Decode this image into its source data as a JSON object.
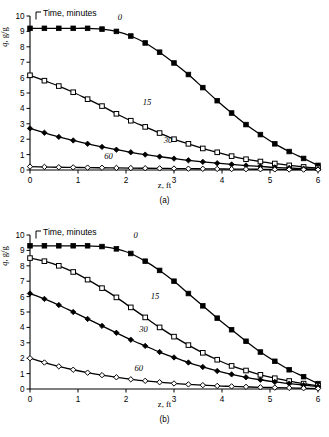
{
  "figure": {
    "axis_labels": {
      "x": "z, ft",
      "y_symbol": "q",
      "y_rest": ", g/g",
      "legend_title": "Time, minutes"
    }
  },
  "chart_data": [
    {
      "type": "line",
      "panel": "(a)",
      "title": "",
      "xlabel": "z, ft",
      "ylabel": "q̄, g/g",
      "legend_title": "Time, minutes",
      "legend_position": "inline-annotations",
      "grid": false,
      "xlim": [
        0,
        6
      ],
      "ylim": [
        0,
        10
      ],
      "xticks": [
        0,
        1,
        2,
        3,
        4,
        5,
        6
      ],
      "yticks": [
        0,
        1,
        2,
        3,
        4,
        5,
        6,
        7,
        8,
        9,
        10
      ],
      "x": [
        0,
        0.3,
        0.6,
        0.9,
        1.2,
        1.5,
        1.8,
        2.1,
        2.4,
        2.7,
        3.0,
        3.3,
        3.6,
        3.9,
        4.2,
        4.5,
        4.8,
        5.1,
        5.4,
        5.7,
        6.0
      ],
      "series": [
        {
          "name": "0",
          "label": "0",
          "marker": "filled-square",
          "values": [
            9.2,
            9.2,
            9.2,
            9.2,
            9.2,
            9.15,
            9.0,
            8.7,
            8.25,
            7.65,
            6.95,
            6.2,
            5.35,
            4.5,
            3.7,
            2.95,
            2.3,
            1.7,
            1.2,
            0.75,
            0.3
          ]
        },
        {
          "name": "15",
          "label": "15",
          "marker": "open-square",
          "values": [
            6.15,
            5.8,
            5.45,
            5.05,
            4.6,
            4.15,
            3.65,
            3.2,
            2.8,
            2.4,
            2.0,
            1.7,
            1.4,
            1.15,
            0.9,
            0.7,
            0.55,
            0.42,
            0.3,
            0.2,
            0.12
          ]
        },
        {
          "name": "30",
          "label": "30",
          "marker": "filled-diamond",
          "values": [
            2.7,
            2.42,
            2.15,
            1.92,
            1.7,
            1.5,
            1.32,
            1.15,
            1.0,
            0.87,
            0.74,
            0.63,
            0.53,
            0.44,
            0.36,
            0.29,
            0.23,
            0.17,
            0.13,
            0.09,
            0.05
          ]
        },
        {
          "name": "60",
          "label": "60",
          "marker": "open-diamond",
          "values": [
            0.22,
            0.2,
            0.18,
            0.17,
            0.155,
            0.145,
            0.135,
            0.125,
            0.115,
            0.105,
            0.095,
            0.085,
            0.077,
            0.069,
            0.061,
            0.054,
            0.047,
            0.04,
            0.033,
            0.026,
            0.02
          ]
        }
      ]
    },
    {
      "type": "line",
      "panel": "(b)",
      "title": "",
      "xlabel": "z, ft",
      "ylabel": "q̄, g/g",
      "legend_title": "Time, minutes",
      "legend_position": "inline-annotations",
      "grid": false,
      "xlim": [
        0,
        6
      ],
      "ylim": [
        0,
        10
      ],
      "xticks": [
        0,
        1,
        2,
        3,
        4,
        5,
        6
      ],
      "yticks": [
        0,
        1,
        2,
        3,
        4,
        5,
        6,
        7,
        8,
        9,
        10
      ],
      "x": [
        0,
        0.3,
        0.6,
        0.9,
        1.2,
        1.5,
        1.8,
        2.1,
        2.4,
        2.7,
        3.0,
        3.3,
        3.6,
        3.9,
        4.2,
        4.5,
        4.8,
        5.1,
        5.4,
        5.7,
        6.0
      ],
      "series": [
        {
          "name": "0",
          "label": "0",
          "marker": "filled-square",
          "values": [
            9.3,
            9.3,
            9.3,
            9.3,
            9.3,
            9.25,
            9.1,
            8.8,
            8.3,
            7.7,
            7.0,
            6.2,
            5.4,
            4.6,
            3.85,
            3.1,
            2.4,
            1.8,
            1.25,
            0.8,
            0.35
          ]
        },
        {
          "name": "15",
          "label": "15",
          "marker": "open-square",
          "values": [
            8.5,
            8.3,
            8.0,
            7.6,
            7.1,
            6.55,
            5.95,
            5.3,
            4.65,
            4.0,
            3.4,
            2.85,
            2.35,
            1.9,
            1.5,
            1.2,
            0.92,
            0.7,
            0.52,
            0.35,
            0.22
          ]
        },
        {
          "name": "30",
          "label": "30",
          "marker": "filled-diamond",
          "values": [
            6.2,
            5.85,
            5.45,
            5.0,
            4.55,
            4.1,
            3.65,
            3.2,
            2.8,
            2.4,
            2.05,
            1.72,
            1.43,
            1.17,
            0.95,
            0.76,
            0.6,
            0.46,
            0.35,
            0.25,
            0.15
          ]
        },
        {
          "name": "60",
          "label": "60",
          "marker": "open-diamond",
          "values": [
            2.0,
            1.72,
            1.47,
            1.25,
            1.06,
            0.9,
            0.76,
            0.63,
            0.53,
            0.44,
            0.36,
            0.3,
            0.25,
            0.2,
            0.17,
            0.14,
            0.11,
            0.09,
            0.07,
            0.05,
            0.03
          ]
        }
      ]
    }
  ]
}
